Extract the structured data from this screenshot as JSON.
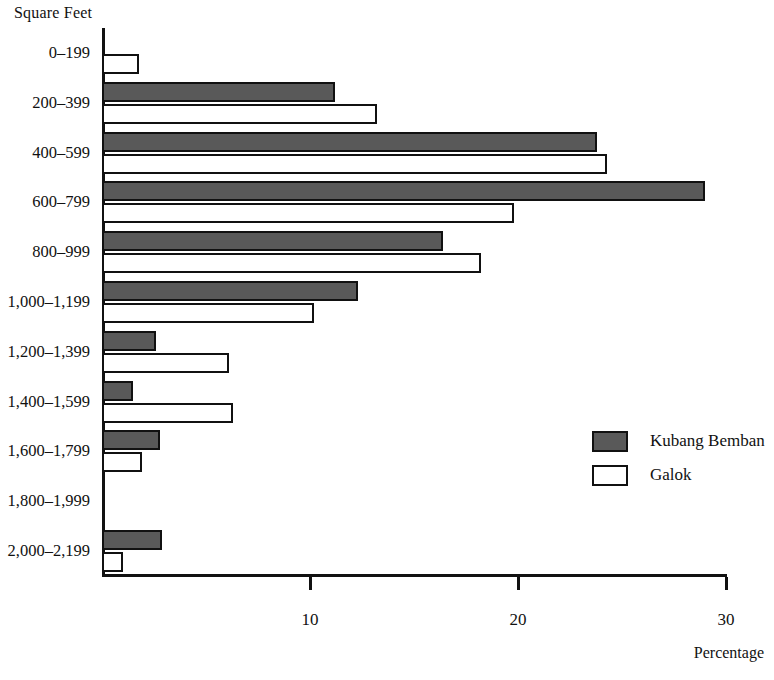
{
  "chart_data": {
    "type": "bar",
    "orientation": "horizontal",
    "title": "",
    "xlabel": "Percentage",
    "ylabel": "Square Feet",
    "xlim": [
      0,
      30
    ],
    "xticks": [
      10,
      20,
      30
    ],
    "xtick_labels": [
      "10",
      "20",
      "30"
    ],
    "grid": false,
    "legend_position": "right-middle",
    "categories": [
      "0–199",
      "200–399",
      "400–599",
      "600–799",
      "800–999",
      "1,000–1,199",
      "1,200–1,399",
      "1,400–1,599",
      "1,600–1,799",
      "1,800–1,999",
      "2,000–2,199"
    ],
    "series": [
      {
        "name": "Kubang Bemban",
        "color": "#595959",
        "values": [
          0,
          11.2,
          23.8,
          29.0,
          16.4,
          12.3,
          2.6,
          1.5,
          2.8,
          0,
          2.9
        ]
      },
      {
        "name": "Galok",
        "color": "#ffffff",
        "values": [
          1.8,
          13.2,
          24.3,
          19.8,
          18.2,
          10.2,
          6.1,
          6.3,
          1.9,
          0,
          1.0
        ]
      }
    ]
  },
  "legend": {
    "entries": [
      {
        "label": "Kubang Bemban",
        "swatch": "kb"
      },
      {
        "label": "Galok",
        "swatch": "gl"
      }
    ]
  }
}
